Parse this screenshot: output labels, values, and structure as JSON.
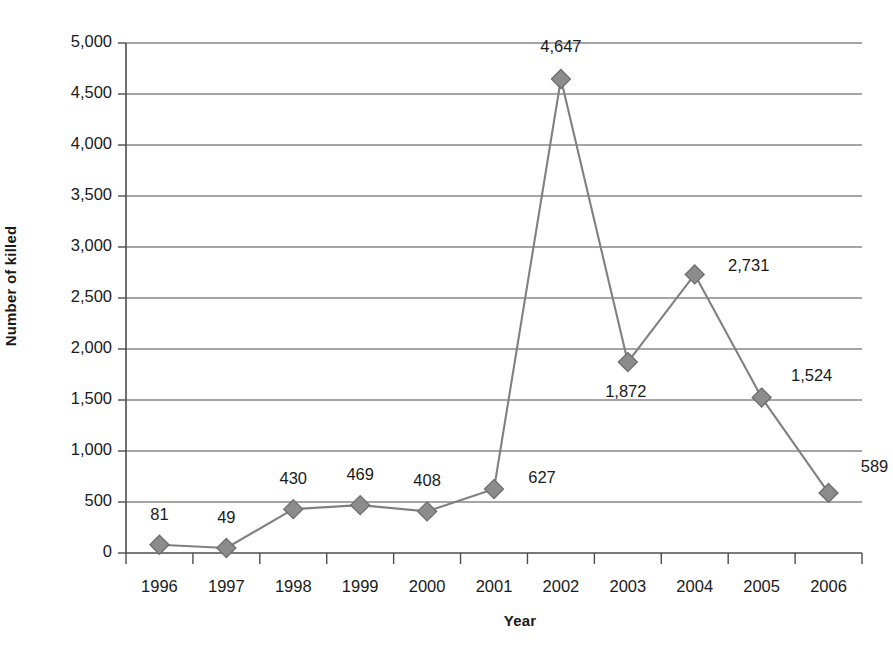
{
  "chart_data": {
    "type": "line",
    "title": "",
    "xlabel": "Year",
    "ylabel": "Number of killed",
    "categories": [
      "1996",
      "1997",
      "1998",
      "1999",
      "2000",
      "2001",
      "2002",
      "2003",
      "2004",
      "2005",
      "2006"
    ],
    "values": [
      81,
      49,
      430,
      469,
      408,
      627,
      4647,
      1872,
      2731,
      1524,
      589
    ],
    "data_labels": [
      "81",
      "49",
      "430",
      "469",
      "408",
      "627",
      "4,647",
      "1,872",
      "2,731",
      "1,524",
      "589"
    ],
    "ylim": [
      0,
      5000
    ],
    "ytick_values": [
      0,
      500,
      1000,
      1500,
      2000,
      2500,
      3000,
      3500,
      4000,
      4500,
      5000
    ],
    "ytick_labels": [
      "0",
      "500",
      "1,000",
      "1,500",
      "2,000",
      "2,500",
      "3,000",
      "3,500",
      "4,000",
      "4,500",
      "5,000"
    ],
    "grid": "horizontal",
    "legend": "none",
    "series_color": "#808080",
    "marker": "diamond",
    "marker_color": "#8c8c8c",
    "marker_edge_color": "#6e6e6e",
    "axis_color": "#4d4d4d",
    "background": "#ffffff",
    "label_offsets": [
      {
        "dx": 0,
        "dy": -30
      },
      {
        "dx": 0,
        "dy": -30
      },
      {
        "dx": 0,
        "dy": -30
      },
      {
        "dx": 0,
        "dy": -30
      },
      {
        "dx": 0,
        "dy": -30
      },
      {
        "dx": 48,
        "dy": -11
      },
      {
        "dx": 0,
        "dy": -32
      },
      {
        "dx": -2,
        "dy": 30
      },
      {
        "dx": 54,
        "dy": -8
      },
      {
        "dx": 50,
        "dy": -22
      },
      {
        "dx": 46,
        "dy": -26
      }
    ]
  }
}
